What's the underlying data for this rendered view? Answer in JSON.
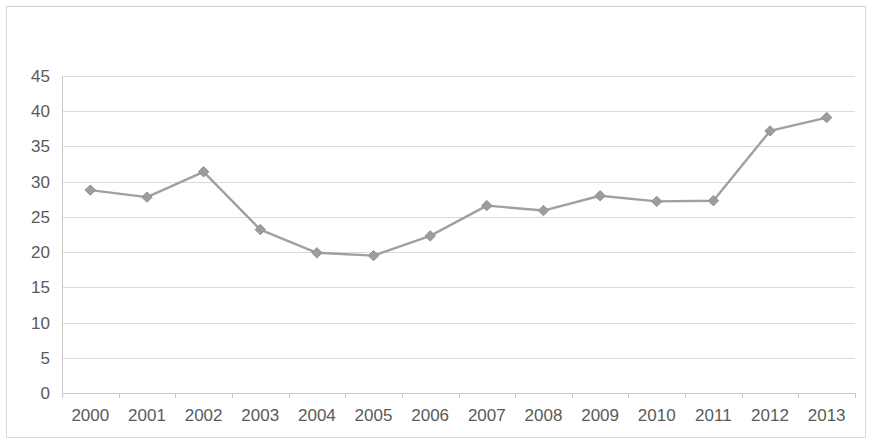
{
  "chart_data": {
    "type": "line",
    "title": "",
    "subtitle": "",
    "xlabel": "",
    "ylabel": "",
    "categories": [
      "2000",
      "2001",
      "2002",
      "2003",
      "2004",
      "2005",
      "2006",
      "2007",
      "2008",
      "2009",
      "2010",
      "2011",
      "2012",
      "2013"
    ],
    "values": [
      28.8,
      27.8,
      31.4,
      23.2,
      19.9,
      19.5,
      22.3,
      26.6,
      25.9,
      28.0,
      27.2,
      27.3,
      37.2,
      39.1
    ],
    "series": [
      {
        "name": "",
        "values": [
          28.8,
          27.8,
          31.4,
          23.2,
          19.9,
          19.5,
          22.3,
          26.6,
          25.9,
          28.0,
          27.2,
          27.3,
          37.2,
          39.1
        ]
      }
    ],
    "ylim": [
      0,
      45
    ],
    "y_ticks": [
      0,
      5,
      10,
      15,
      20,
      25,
      30,
      35,
      40,
      45
    ],
    "y_tick_labels": [
      "0",
      "5",
      "10",
      "15",
      "20",
      "25",
      "30",
      "35",
      "40",
      "45"
    ],
    "x_tick_labels": [
      "2000",
      "2001",
      "2002",
      "2003",
      "2004",
      "2005",
      "2006",
      "2007",
      "2008",
      "2009",
      "2010",
      "2011",
      "2012",
      "2013"
    ],
    "grid": true,
    "grid_axis": "y",
    "legend": false,
    "legend_position": "none",
    "marker": "diamond",
    "annotations": [],
    "colors": {
      "line": "#a0a0a0",
      "marker": "#9d9d9d",
      "gridline": "#d6dce4",
      "axis": "#c8c8c8",
      "tick_text": "#5a5a5a",
      "background": "#ffffff",
      "frame": "#d9d9d9"
    }
  },
  "figure": {
    "width": 872,
    "height": 444
  }
}
